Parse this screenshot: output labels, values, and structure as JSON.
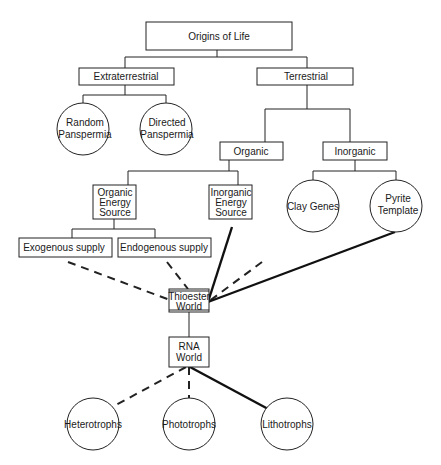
{
  "diagram": {
    "title": "Origins of Life",
    "nodes": {
      "root": {
        "label": "Origins of Life"
      },
      "extraterrestrial": {
        "label": "Extraterrestrial"
      },
      "terrestrial": {
        "label": "Terrestrial"
      },
      "random_panspermia": {
        "line1": "Random",
        "line2": "Panspermia"
      },
      "directed_panspermia": {
        "line1": "Directed",
        "line2": "Panspermia"
      },
      "organic": {
        "label": "Organic"
      },
      "inorganic": {
        "label": "Inorganic"
      },
      "organic_energy": {
        "line1": "Organic",
        "line2": "Energy",
        "line3": "Source"
      },
      "inorganic_energy": {
        "line1": "Inorganic",
        "line2": "Energy",
        "line3": "Source"
      },
      "clay_genes": {
        "label": "Clay Genes"
      },
      "pyrite_template": {
        "line1": "Pyrite",
        "line2": "Template"
      },
      "exogenous": {
        "label": "Exogenous supply"
      },
      "endogenous": {
        "label": "Endogenous supply"
      },
      "thioester": {
        "line1": "Thioester",
        "line2": "World"
      },
      "rna": {
        "line1": "RNA",
        "line2": "World"
      },
      "heterotrophs": {
        "label": "Heterotrophs"
      },
      "phototrophs": {
        "label": "Phototrophs"
      },
      "lithotrophs": {
        "label": "Lithotrophs"
      }
    },
    "edges": [
      {
        "from": "root",
        "to": "extraterrestrial",
        "style": "solid"
      },
      {
        "from": "root",
        "to": "terrestrial",
        "style": "solid"
      },
      {
        "from": "extraterrestrial",
        "to": "random_panspermia",
        "style": "solid"
      },
      {
        "from": "extraterrestrial",
        "to": "directed_panspermia",
        "style": "solid"
      },
      {
        "from": "terrestrial",
        "to": "organic",
        "style": "solid"
      },
      {
        "from": "terrestrial",
        "to": "inorganic",
        "style": "solid"
      },
      {
        "from": "organic",
        "to": "organic_energy",
        "style": "solid"
      },
      {
        "from": "organic",
        "to": "inorganic_energy",
        "style": "solid"
      },
      {
        "from": "inorganic",
        "to": "clay_genes",
        "style": "solid"
      },
      {
        "from": "inorganic",
        "to": "pyrite_template",
        "style": "solid"
      },
      {
        "from": "organic_energy",
        "to": "exogenous",
        "style": "solid"
      },
      {
        "from": "organic_energy",
        "to": "endogenous",
        "style": "solid"
      },
      {
        "from": "exogenous",
        "to": "thioester",
        "style": "dashed"
      },
      {
        "from": "endogenous",
        "to": "thioester",
        "style": "dashed"
      },
      {
        "from": "inorganic_energy",
        "to": "thioester",
        "style": "thick"
      },
      {
        "from": "clay_genes",
        "to": "thioester",
        "style": "dashed"
      },
      {
        "from": "pyrite_template",
        "to": "thioester",
        "style": "thick"
      },
      {
        "from": "thioester",
        "to": "rna",
        "style": "solid"
      },
      {
        "from": "rna",
        "to": "heterotrophs",
        "style": "dashed"
      },
      {
        "from": "rna",
        "to": "phototrophs",
        "style": "dashed"
      },
      {
        "from": "rna",
        "to": "lithotrophs",
        "style": "thick"
      }
    ]
  }
}
